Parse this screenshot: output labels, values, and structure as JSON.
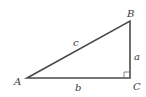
{
  "diagram": {
    "type": "right-triangle",
    "vertices": {
      "A": {
        "label": "A"
      },
      "B": {
        "label": "B"
      },
      "C": {
        "label": "C"
      }
    },
    "sides": {
      "a": {
        "label": "a"
      },
      "b": {
        "label": "b"
      },
      "c": {
        "label": "c"
      }
    },
    "right_angle_at": "C",
    "colors": {
      "line": "#4a4a4a",
      "text": "#3a3a3a",
      "background": "#ffffff"
    }
  }
}
